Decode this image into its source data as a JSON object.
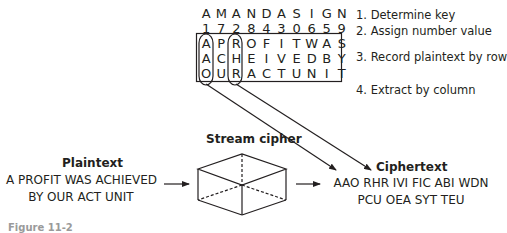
{
  "transposition": {
    "key": [
      "A",
      "M",
      "A",
      "N",
      "D",
      "A",
      "S",
      "I",
      "G",
      "N"
    ],
    "numbers": [
      "1",
      "7",
      "2",
      "8",
      "4",
      "3",
      "0",
      "6",
      "5",
      "9"
    ],
    "rows": [
      [
        "A",
        "P",
        "R",
        "O",
        "F",
        "I",
        "T",
        "W",
        "A",
        "S"
      ],
      [
        "A",
        "C",
        "H",
        "E",
        "I",
        "V",
        "E",
        "D",
        "B",
        "Y"
      ],
      [
        "O",
        "U",
        "R",
        "A",
        "C",
        "T",
        "U",
        "N",
        "I",
        "T"
      ]
    ],
    "highlighted_columns": [
      0,
      2
    ]
  },
  "steps": [
    "1. Determine key",
    "2. Assign number value",
    "3. Record plaintext by row",
    "4. Extract by column"
  ],
  "plaintext": {
    "label": "Plaintext",
    "lines": [
      "A PROFIT WAS ACHIEVED",
      "BY OUR ACT UNIT"
    ]
  },
  "cipher": {
    "label": "Stream cipher"
  },
  "ciphertext": {
    "label": "Ciphertext",
    "lines": [
      "AAO RHR IVI FIC ABI WDN",
      "PCU OEA SYT TEU"
    ]
  },
  "caption": {
    "text": "Figure 11-2"
  },
  "colors": {
    "ink": "#231f20",
    "background": "#ffffff"
  }
}
